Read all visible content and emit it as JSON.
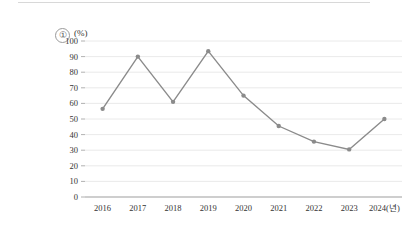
{
  "figure": {
    "item_number": "①",
    "unit_label": "(%)"
  },
  "chart_data": {
    "type": "line",
    "title": "",
    "subtitle": "",
    "xlabel": "(년)",
    "ylabel": "(%)",
    "categories": [
      "2016",
      "2017",
      "2018",
      "2019",
      "2020",
      "2021",
      "2022",
      "2023",
      "2024"
    ],
    "values": [
      56.5,
      90,
      61,
      93.5,
      65,
      45.5,
      35.5,
      30.5,
      50
    ],
    "x_tick_labels": [
      "2016",
      "2017",
      "2018",
      "2019",
      "2020",
      "2021",
      "2022",
      "2023",
      "2024(년)"
    ],
    "y_tick_labels": [
      "0",
      "10",
      "20",
      "30",
      "40",
      "50",
      "60",
      "70",
      "80",
      "90",
      "100"
    ],
    "y_ticks": [
      0,
      10,
      20,
      30,
      40,
      50,
      60,
      70,
      80,
      90,
      100
    ],
    "ylim": [
      0,
      100
    ],
    "grid": "horizontal",
    "legend": "none",
    "series": [
      {
        "name": "",
        "values": [
          56.5,
          90,
          61,
          93.5,
          65,
          45.5,
          35.5,
          30.5,
          50
        ],
        "line_color": "#8b8b8b",
        "marker": "circle",
        "marker_color": "#8b8b8b"
      }
    ],
    "colors": {
      "line": "#8b8b8b",
      "grid": "#e4e4e4",
      "axis": "#9d9d9d",
      "text": "#333333",
      "background": "#ffffff"
    }
  }
}
